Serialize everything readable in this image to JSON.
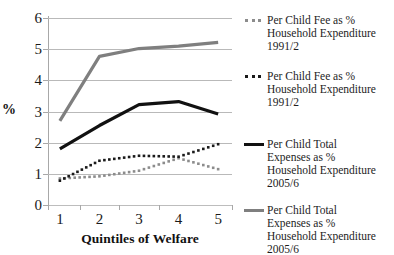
{
  "chart_data": {
    "type": "line",
    "title": "",
    "subtitle": "",
    "xlabel": "Quintiles of Welfare",
    "ylabel": "%",
    "categories": [
      "1",
      "2",
      "3",
      "4",
      "5"
    ],
    "x": [
      1,
      2,
      3,
      4,
      5
    ],
    "xlim": [
      0.7,
      5.35
    ],
    "ylim": [
      0,
      6
    ],
    "y_ticks": [
      "0",
      "1",
      "2",
      "3",
      "4",
      "5",
      "6"
    ],
    "y_tick_values": [
      0,
      1,
      2,
      3,
      4,
      5,
      6
    ],
    "grid": "horizontal",
    "legend_position": "right",
    "series": [
      {
        "name": "Per Child Fee as %\nHousehold Expenditure\n1991/2",
        "style": "dotted",
        "color": "#8c8c8c",
        "values": [
          0.85,
          0.92,
          1.1,
          1.5,
          1.15
        ]
      },
      {
        "name": "Per Child Fee as %\nHousehold Expenditure\n1991/2",
        "style": "dotted",
        "color": "#1a1a1a",
        "values": [
          0.78,
          1.42,
          1.58,
          1.55,
          1.95
        ]
      },
      {
        "name": "Per Child Total\nExpenses as %\nHousehold Expenditure\n2005/6",
        "style": "solid",
        "color": "#111111",
        "values": [
          1.8,
          2.55,
          3.22,
          3.32,
          2.92
        ]
      },
      {
        "name": "Per Child Total\nExpenses as %\nHousehold Expenditure\n2005/6",
        "style": "solid",
        "color": "#7f7f7f",
        "values": [
          2.7,
          4.77,
          5.02,
          5.1,
          5.22
        ]
      }
    ]
  },
  "legend": {
    "entries": [
      {
        "label": "Per Child Fee as %\nHousehold Expenditure\n1991/2",
        "marker": "dotted-line-gray",
        "color": "#8c8c8c"
      },
      {
        "label": "Per Child Fee as %\nHousehold Expenditure\n1991/2",
        "marker": "dotted-line-black",
        "color": "#1a1a1a"
      },
      {
        "label": "Per Child Total\nExpenses as %\nHousehold Expenditure\n2005/6",
        "marker": "solid-line-black",
        "color": "#111111"
      },
      {
        "label": "Per Child Total\nExpenses as %\nHousehold Expenditure\n2005/6",
        "marker": "solid-line-gray",
        "color": "#7f7f7f"
      }
    ]
  },
  "axes": {
    "y_title": "%",
    "x_title": "Quintiles of Welfare",
    "y_labels": [
      "6",
      "5",
      "4",
      "3",
      "2",
      "1",
      "0"
    ],
    "x_labels": [
      "1",
      "2",
      "3",
      "4",
      "5"
    ]
  },
  "colors": {
    "gridline": "#b9b9b9",
    "axis": "#a8a8a8",
    "gray_series": "#7f7f7f",
    "black_series": "#111111",
    "text": "#1a1a1a"
  }
}
